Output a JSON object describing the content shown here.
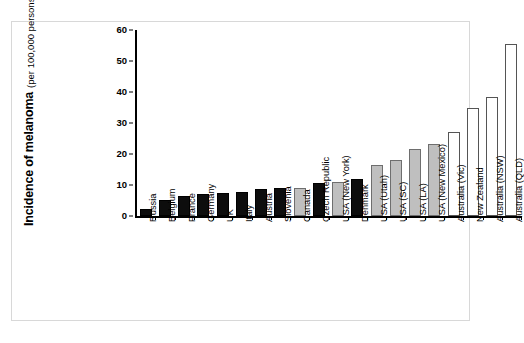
{
  "chart_data": {
    "type": "bar",
    "title": "",
    "subtitle": "",
    "xlabel": "",
    "ylabel": "Incidence of melanoma",
    "ylabel_sub": "(per 100,000 persons-years)",
    "ylim": [
      0,
      60
    ],
    "yticks": [
      0,
      10,
      20,
      30,
      40,
      50,
      60
    ],
    "grid": false,
    "legend": null,
    "categories": [
      "Russia",
      "Belgium",
      "France",
      "Germany",
      "UK",
      "Italy",
      "Austria",
      "Slovenia",
      "Canada",
      "Czech Republic",
      "USA (New York)",
      "Denmark",
      "USA (Utah)",
      "USA (SC)",
      "USA (LA)",
      "USA (New Mexico)",
      "Australia (Vic)",
      "New Zealand",
      "Australia (NSW)",
      "Australia (QLD)"
    ],
    "values": [
      2.2,
      5.2,
      6.6,
      7.2,
      7.4,
      7.6,
      8.7,
      8.9,
      9.1,
      10.6,
      10.9,
      12.0,
      16.6,
      18.2,
      21.5,
      23.2,
      27.1,
      34.7,
      38.4,
      55.5
    ],
    "bar_colors": [
      "black",
      "black",
      "black",
      "black",
      "black",
      "black",
      "black",
      "black",
      "gray",
      "black",
      "gray",
      "black",
      "gray",
      "gray",
      "gray",
      "gray",
      "white",
      "white",
      "white",
      "white"
    ],
    "color_map": {
      "black": "#0d0d0d",
      "gray": "#bfbfbf",
      "white": "#ffffff"
    }
  }
}
